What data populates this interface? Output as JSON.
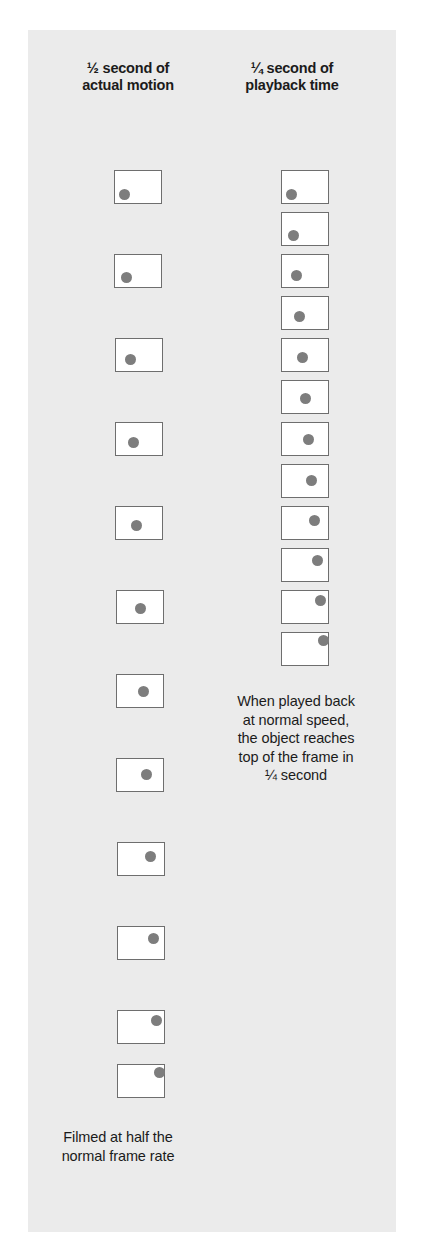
{
  "figure": {
    "panel_bg": "#ebebeb",
    "frame_border_color": "#6e6e6e",
    "frame_fill": "#ffffff",
    "dot_color": "#7d7d7d",
    "headers": {
      "left_line1": "½ second of",
      "left_line2": "actual motion",
      "right_line1": "¼ second of",
      "right_line2": "playback time"
    },
    "captions": {
      "playback_line1": "When played back",
      "playback_line2": "at normal speed,",
      "playback_line3": "the object reaches",
      "playback_line4": "top of the frame in",
      "playback_line5": "¼ second",
      "filmed_line1": "Filmed at half the",
      "filmed_line2": "normal frame rate"
    }
  },
  "chart_data": {
    "type": "diagram",
    "frame_size": {
      "w": 48,
      "h": 34
    },
    "dot_diameter": 11,
    "columns": [
      {
        "name": "actual-motion",
        "label": "½ second of actual motion",
        "frame_count": 12,
        "pitch_y": 84,
        "frames": [
          {
            "index": 1,
            "x": 114,
            "y": 170,
            "dot_x": 4,
            "dot_y": 18
          },
          {
            "index": 2,
            "x": 114,
            "y": 254,
            "dot_x": 6,
            "dot_y": 17
          },
          {
            "index": 3,
            "x": 115,
            "y": 338,
            "dot_x": 9,
            "dot_y": 15
          },
          {
            "index": 4,
            "x": 115,
            "y": 422,
            "dot_x": 12,
            "dot_y": 14
          },
          {
            "index": 5,
            "x": 115,
            "y": 506,
            "dot_x": 15,
            "dot_y": 13
          },
          {
            "index": 6,
            "x": 116,
            "y": 590,
            "dot_x": 18,
            "dot_y": 12
          },
          {
            "index": 7,
            "x": 116,
            "y": 674,
            "dot_x": 21,
            "dot_y": 11
          },
          {
            "index": 8,
            "x": 116,
            "y": 758,
            "dot_x": 24,
            "dot_y": 10
          },
          {
            "index": 9,
            "x": 117,
            "y": 842,
            "dot_x": 27,
            "dot_y": 8
          },
          {
            "index": 10,
            "x": 117,
            "y": 926,
            "dot_x": 30,
            "dot_y": 6
          },
          {
            "index": 11,
            "x": 117,
            "y": 1010,
            "dot_x": 33,
            "dot_y": 4
          },
          {
            "index": 12,
            "x": 117,
            "y": 1064,
            "dot_x": 36,
            "dot_y": 2
          }
        ]
      },
      {
        "name": "playback-time",
        "label": "¼ second of playback time",
        "frame_count": 12,
        "pitch_y": 42,
        "frames": [
          {
            "index": 1,
            "x": 281,
            "y": 170,
            "dot_x": 4,
            "dot_y": 18
          },
          {
            "index": 2,
            "x": 281,
            "y": 212,
            "dot_x": 6,
            "dot_y": 17
          },
          {
            "index": 3,
            "x": 281,
            "y": 254,
            "dot_x": 9,
            "dot_y": 15
          },
          {
            "index": 4,
            "x": 281,
            "y": 296,
            "dot_x": 12,
            "dot_y": 14
          },
          {
            "index": 5,
            "x": 281,
            "y": 338,
            "dot_x": 15,
            "dot_y": 13
          },
          {
            "index": 6,
            "x": 281,
            "y": 380,
            "dot_x": 18,
            "dot_y": 12
          },
          {
            "index": 7,
            "x": 281,
            "y": 422,
            "dot_x": 21,
            "dot_y": 11
          },
          {
            "index": 8,
            "x": 281,
            "y": 464,
            "dot_x": 24,
            "dot_y": 10
          },
          {
            "index": 9,
            "x": 281,
            "y": 506,
            "dot_x": 27,
            "dot_y": 8
          },
          {
            "index": 10,
            "x": 281,
            "y": 548,
            "dot_x": 30,
            "dot_y": 6
          },
          {
            "index": 11,
            "x": 281,
            "y": 590,
            "dot_x": 33,
            "dot_y": 4
          },
          {
            "index": 12,
            "x": 281,
            "y": 632,
            "dot_x": 36,
            "dot_y": 2
          }
        ]
      }
    ]
  }
}
